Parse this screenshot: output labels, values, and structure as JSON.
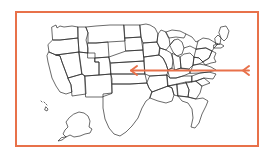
{
  "figure": {
    "kind": "annotated-map-figure",
    "background_color": "#ffffff",
    "frame": {
      "shape": "rectangle",
      "border_color": "#e8714a",
      "border_width_px": 2,
      "x": 15,
      "y": 11,
      "width": 244,
      "height": 136
    }
  },
  "map": {
    "name": "united-states-outline-map",
    "region": "United States of America",
    "style": "black line-art state boundaries, unfilled",
    "stroke_color": "#2b2b2b",
    "fill_color": "none",
    "includes_insets": [
      "Alaska",
      "Hawaii"
    ],
    "labels_visible": false
  },
  "annotation": {
    "name": "horizontal-arrow-annotation",
    "color": "#e8714a",
    "stroke_width_px": 2,
    "shape": "horizontal line with left-pointing chevron arrowheads at both ends",
    "start_x": 131,
    "end_x": 249,
    "y": 70,
    "origin_description": "central United States (Kansas / Missouri area)",
    "direction": "points left (westward)",
    "extends_outside_map": true
  },
  "colors": {
    "accent": "#e8714a",
    "map_line": "#2b2b2b",
    "page_background": "#ffffff"
  }
}
